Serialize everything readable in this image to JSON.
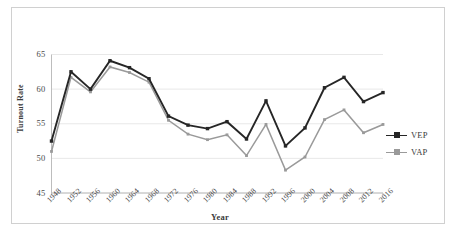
{
  "chart_data": {
    "type": "line",
    "title": "",
    "xlabel": "Year",
    "ylabel": "Turnout Rate",
    "grid": true,
    "legend_position": "right",
    "xlim": [
      1948,
      2016
    ],
    "ylim": [
      45,
      65
    ],
    "ytick_labels": [
      "65",
      "60",
      "55",
      "50",
      "45"
    ],
    "yticks": [
      65,
      60,
      55,
      50,
      45
    ],
    "categories": [
      "1948",
      "1952",
      "1956",
      "1960",
      "1964",
      "1968",
      "1972",
      "1976",
      "1980",
      "1984",
      "1988",
      "1992",
      "1996",
      "2000",
      "2004",
      "2008",
      "2012",
      "2016"
    ],
    "series": [
      {
        "name": "VEP",
        "color": "#262626",
        "marker": "square",
        "values": [
          52.5,
          62.5,
          60.0,
          64.1,
          63.1,
          61.5,
          56.1,
          54.8,
          54.3,
          55.3,
          52.8,
          58.3,
          51.8,
          54.4,
          60.2,
          61.7,
          58.2,
          59.5
        ]
      },
      {
        "name": "VAP",
        "color": "#9a9a9a",
        "marker": "square",
        "values": [
          51.0,
          61.7,
          59.6,
          63.2,
          62.4,
          61.0,
          55.5,
          53.5,
          52.7,
          53.4,
          50.4,
          54.9,
          48.3,
          50.2,
          55.6,
          57.0,
          53.7,
          54.9
        ]
      }
    ]
  },
  "legend": {
    "items": [
      {
        "label": "VEP",
        "color": "#262626"
      },
      {
        "label": "VAP",
        "color": "#9a9a9a"
      }
    ]
  },
  "axis_titles": {
    "x": "Year",
    "y": "Turnout Rate"
  }
}
